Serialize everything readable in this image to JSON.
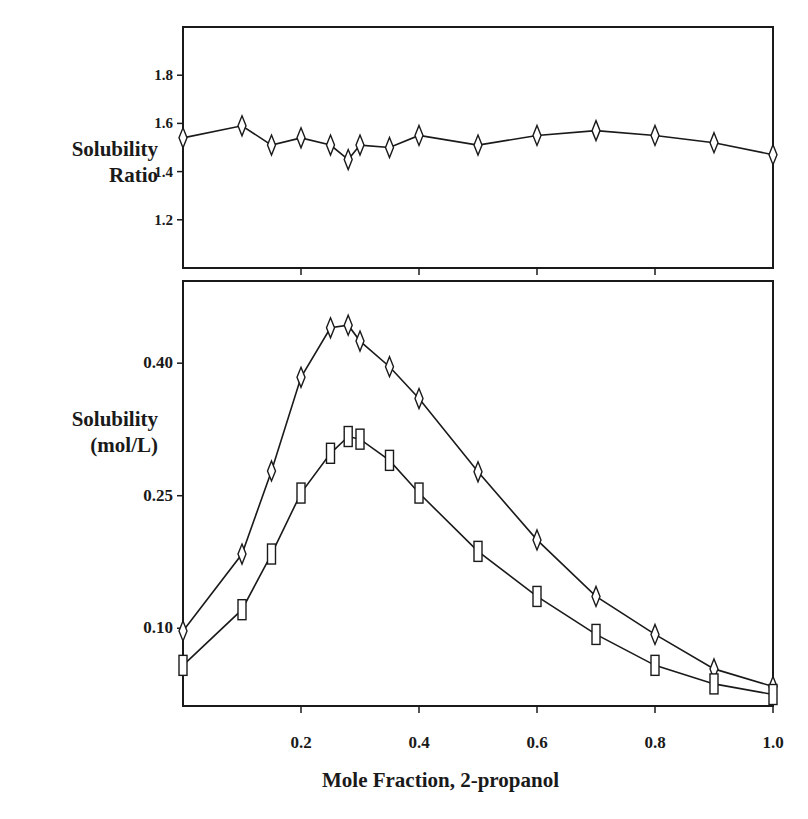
{
  "colors": {
    "ink": "#1a1a1a",
    "background": "#ffffff"
  },
  "chart_data": [
    {
      "type": "line",
      "panel": "top",
      "title": "",
      "xlabel": "Mole Fraction, 2-propanol",
      "ylabel_lines": [
        "Solubility",
        "Ratio"
      ],
      "xlim": [
        0,
        1.0
      ],
      "ylim": [
        1.0,
        2.0
      ],
      "yticks": [
        1.2,
        1.4,
        1.6,
        1.8
      ],
      "ytick_labels": [
        "1.2",
        "1.4",
        "1.6",
        "1.8"
      ],
      "xticks": [
        0.2,
        0.4,
        0.6,
        0.8
      ],
      "grid": false,
      "series": [
        {
          "name": "Solubility ratio",
          "marker": "diamond",
          "x": [
            0,
            0.1,
            0.15,
            0.2,
            0.25,
            0.28,
            0.3,
            0.35,
            0.4,
            0.5,
            0.6,
            0.7,
            0.8,
            0.9,
            1.0
          ],
          "values": [
            1.54,
            1.59,
            1.51,
            1.54,
            1.51,
            1.45,
            1.51,
            1.5,
            1.55,
            1.51,
            1.55,
            1.57,
            1.55,
            1.52,
            1.47
          ]
        }
      ]
    },
    {
      "type": "line",
      "panel": "bottom",
      "title": "",
      "xlabel": "Mole Fraction, 2-propanol",
      "ylabel_lines": [
        "Solubility",
        "(mol/L)"
      ],
      "xlim": [
        0,
        1.0
      ],
      "ylim": [
        0.012,
        0.493
      ],
      "yticks": [
        0.1,
        0.25,
        0.4
      ],
      "ytick_labels": [
        "0.10",
        "0.25",
        "0.40"
      ],
      "xticks": [
        0.2,
        0.4,
        0.6,
        0.8,
        1.0
      ],
      "xtick_labels": [
        "0.2",
        "0.4",
        "0.6",
        "0.8",
        "1.0"
      ],
      "grid": false,
      "legend": "none",
      "series": [
        {
          "name": "Series A (diamonds)",
          "marker": "diamond",
          "x": [
            0,
            0.1,
            0.15,
            0.2,
            0.25,
            0.28,
            0.3,
            0.35,
            0.4,
            0.5,
            0.6,
            0.7,
            0.8,
            0.9,
            1.0
          ],
          "values": [
            0.097,
            0.184,
            0.278,
            0.384,
            0.44,
            0.443,
            0.425,
            0.396,
            0.36,
            0.277,
            0.2,
            0.136,
            0.093,
            0.054,
            0.034
          ]
        },
        {
          "name": "Series B (squares)",
          "marker": "square",
          "x": [
            0,
            0.1,
            0.15,
            0.2,
            0.25,
            0.28,
            0.3,
            0.35,
            0.4,
            0.5,
            0.6,
            0.7,
            0.8,
            0.9,
            1.0
          ],
          "values": [
            0.058,
            0.121,
            0.184,
            0.253,
            0.298,
            0.317,
            0.314,
            0.29,
            0.253,
            0.187,
            0.136,
            0.093,
            0.058,
            0.037,
            0.025
          ]
        }
      ]
    }
  ],
  "labels": {
    "top_ylabel_1": "Solubility",
    "top_ylabel_2": "Ratio",
    "bottom_ylabel_1": "Solubility",
    "bottom_ylabel_2": "(mol/L)",
    "xlabel": "Mole Fraction, 2-propanol"
  }
}
